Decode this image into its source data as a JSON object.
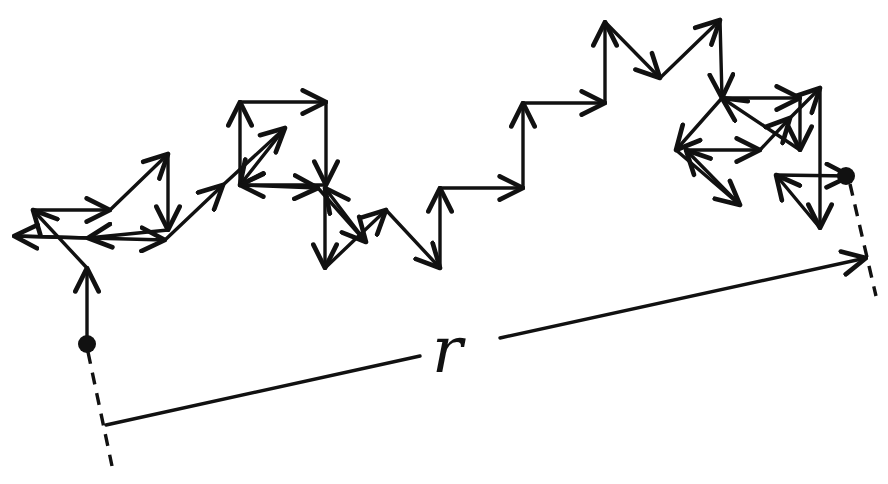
{
  "diagram": {
    "title": "",
    "type": "random-walk",
    "label_r": "r",
    "colors": {
      "ink": "#111111",
      "background": "#ffffff"
    },
    "start_point": [
      87,
      344
    ],
    "end_point": [
      846,
      176
    ],
    "displacement_arrow": {
      "from": [
        106,
        425
      ],
      "to": [
        866,
        258
      ],
      "label": "r"
    },
    "dashed_guides": [
      {
        "from": [
          87,
          350
        ],
        "to": [
          112,
          466
        ]
      },
      {
        "from": [
          850,
          185
        ],
        "to": [
          876,
          295
        ]
      }
    ],
    "walk_path": [
      [
        87,
        344
      ],
      [
        87,
        268
      ],
      [
        33,
        210
      ],
      [
        110,
        210
      ],
      [
        168,
        154
      ],
      [
        168,
        230
      ],
      [
        88,
        238
      ],
      [
        14,
        236
      ],
      [
        165,
        240
      ],
      [
        223,
        185
      ],
      [
        285,
        128
      ],
      [
        240,
        185
      ],
      [
        240,
        102
      ],
      [
        326,
        102
      ],
      [
        326,
        185
      ],
      [
        240,
        185
      ],
      [
        318,
        188
      ],
      [
        366,
        242
      ],
      [
        325,
        188
      ],
      [
        325,
        268
      ],
      [
        386,
        210
      ],
      [
        440,
        268
      ],
      [
        440,
        188
      ],
      [
        523,
        188
      ],
      [
        523,
        103
      ],
      [
        605,
        103
      ],
      [
        605,
        22
      ],
      [
        660,
        78
      ],
      [
        720,
        20
      ],
      [
        722,
        98
      ],
      [
        800,
        98
      ],
      [
        800,
        150
      ],
      [
        722,
        98
      ],
      [
        676,
        150
      ],
      [
        740,
        205
      ],
      [
        686,
        150
      ],
      [
        760,
        150
      ],
      [
        790,
        118
      ],
      [
        820,
        88
      ],
      [
        820,
        228
      ],
      [
        776,
        175
      ],
      [
        850,
        176
      ]
    ]
  }
}
